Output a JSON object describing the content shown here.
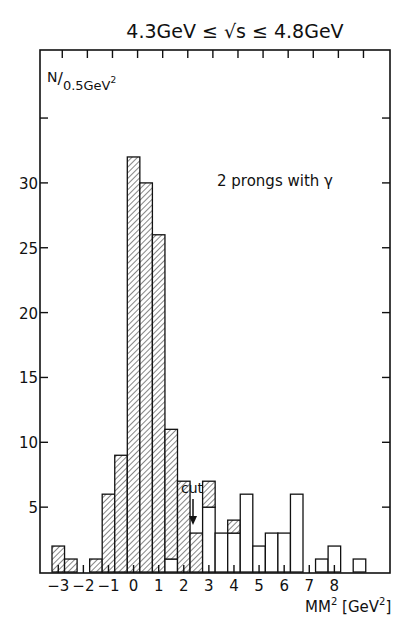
{
  "chart_data": {
    "type": "bar",
    "subtype": "histogram",
    "title": "4.3GeV ≤ √s ≤ 4.8GeV",
    "ylabel": "N/0.5GeV²",
    "xlabel": "MM² [GeV²]",
    "annotation": "2 prongs with γ",
    "cut_label": "cut",
    "cut_position": 2.2,
    "bin_width": 0.5,
    "x_start": -3.25,
    "xlim": [
      -4,
      10.3
    ],
    "ylim": [
      0,
      40
    ],
    "x_ticks": [
      -3,
      -2,
      -1,
      0,
      1,
      2,
      3,
      4,
      5,
      6,
      7,
      8
    ],
    "x_tick_labels": [
      "-3",
      "-2",
      "-1",
      "0",
      "1",
      "2",
      "3",
      "4",
      "5",
      "6",
      "7",
      "8"
    ],
    "x_tick_top": [
      -3,
      -2,
      -1,
      0,
      1,
      2,
      3,
      4,
      5,
      6,
      7,
      8,
      9
    ],
    "y_ticks": [
      5,
      10,
      15,
      20,
      25,
      30,
      35
    ],
    "y_tick_labels": [
      "5",
      "10",
      "15",
      "20",
      "25",
      "30",
      ""
    ],
    "categories": [
      "-3.0",
      "-2.5",
      "-2.0",
      "-1.5",
      "-1.0",
      "-0.5",
      "0.0",
      "0.5",
      "1.0",
      "1.5",
      "2.0",
      "2.5",
      "3.0",
      "3.5",
      "4.0",
      "4.5",
      "5.0",
      "5.5",
      "6.0",
      "6.5",
      "7.0",
      "7.5",
      "8.0",
      "8.5",
      "9.0"
    ],
    "series": [
      {
        "name": "hatched",
        "values": [
          2,
          1,
          0,
          1,
          6,
          9,
          32,
          30,
          26,
          10,
          7,
          3,
          2,
          0,
          1,
          0,
          0,
          0,
          0,
          0,
          0,
          0,
          0,
          0,
          0
        ]
      },
      {
        "name": "open",
        "values": [
          0,
          0,
          0,
          0,
          0,
          0,
          0,
          0,
          0,
          1,
          0,
          0,
          5,
          3,
          3,
          6,
          2,
          3,
          3,
          6,
          0,
          1,
          2,
          0,
          1
        ]
      }
    ],
    "totals": [
      2,
      1,
      0,
      1,
      6,
      9,
      32,
      30,
      26,
      11,
      7,
      3,
      7,
      3,
      4,
      6,
      2,
      3,
      3,
      6,
      0,
      1,
      2,
      0,
      1
    ],
    "hatched_stack_position": [
      "bottom",
      "bottom",
      "bottom",
      "bottom",
      "bottom",
      "bottom",
      "bottom",
      "bottom",
      "bottom",
      "top",
      "bottom",
      "bottom",
      "top",
      "bottom",
      "top",
      "bottom",
      "bottom",
      "bottom",
      "bottom",
      "bottom",
      "bottom",
      "bottom",
      "bottom",
      "bottom",
      "bottom"
    ],
    "grid": false,
    "legend": null
  }
}
